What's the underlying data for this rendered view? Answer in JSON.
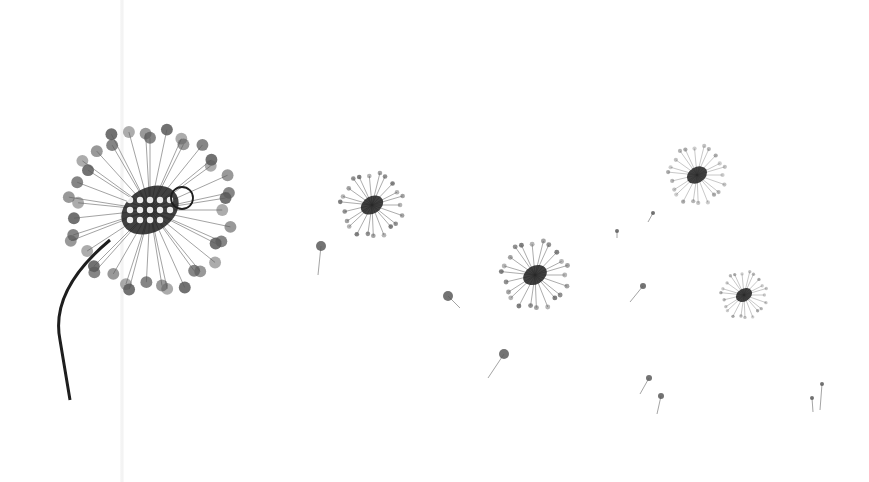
{
  "artwork": {
    "description": "Ink wash illustration of dandelion seed heads drifting across a white background",
    "background_color": "#ffffff",
    "ink_color": "#1e1e1e",
    "seed_color": "#5a5a5a",
    "large_dandelion": {
      "cx": 150,
      "cy": 210,
      "r": 85,
      "stem_end": [
        70,
        400
      ]
    },
    "floating_heads": [
      {
        "cx": 372,
        "cy": 205,
        "r": 33
      },
      {
        "cx": 535,
        "cy": 275,
        "r": 35
      },
      {
        "cx": 697,
        "cy": 175,
        "r": 30
      },
      {
        "cx": 744,
        "cy": 295,
        "r": 24
      }
    ],
    "seeds": [
      {
        "x": 321,
        "y": 246,
        "tx": 318,
        "ty": 275,
        "s": 5
      },
      {
        "x": 448,
        "y": 296,
        "tx": 460,
        "ty": 308,
        "s": 5
      },
      {
        "x": 504,
        "y": 354,
        "tx": 488,
        "ty": 378,
        "s": 5
      },
      {
        "x": 643,
        "y": 286,
        "tx": 630,
        "ty": 302,
        "s": 3
      },
      {
        "x": 653,
        "y": 213,
        "tx": 648,
        "ty": 222,
        "s": 2
      },
      {
        "x": 617,
        "y": 231,
        "tx": 617,
        "ty": 238,
        "s": 2
      },
      {
        "x": 649,
        "y": 378,
        "tx": 640,
        "ty": 394,
        "s": 3
      },
      {
        "x": 661,
        "y": 396,
        "tx": 657,
        "ty": 414,
        "s": 3
      },
      {
        "x": 812,
        "y": 398,
        "tx": 813,
        "ty": 412,
        "s": 2
      },
      {
        "x": 822,
        "y": 384,
        "tx": 820,
        "ty": 410,
        "s": 2
      }
    ]
  }
}
